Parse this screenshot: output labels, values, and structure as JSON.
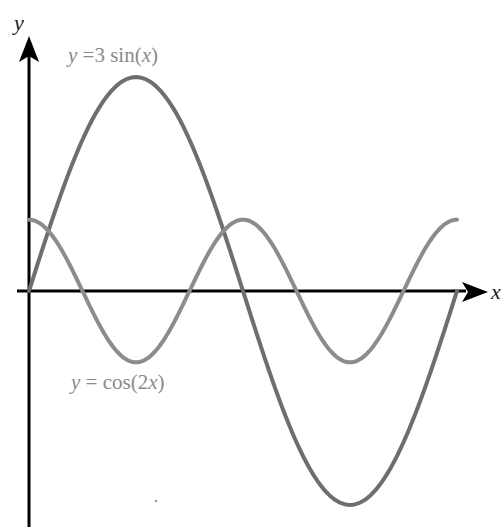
{
  "chart_data": {
    "type": "line",
    "title": "",
    "xlabel": "x",
    "ylabel": "y",
    "xlim": [
      0,
      6.2832
    ],
    "ylim": [
      -3,
      3
    ],
    "grid": false,
    "legend": "inline labels",
    "series": [
      {
        "name": "y = 3 sin(x)",
        "label": "y =3 sin(x)",
        "function": "3*sin(x)",
        "color": "#6e6e6e",
        "x": [
          0,
          0.7854,
          1.5708,
          2.3562,
          3.1416,
          3.927,
          4.7124,
          5.4978,
          6.2832
        ],
        "values": [
          0,
          2.12,
          3,
          2.12,
          0,
          -2.12,
          -3,
          -2.12,
          0
        ]
      },
      {
        "name": "y = cos(2x)",
        "label": "y = cos(2x)",
        "function": "cos(2*x)",
        "color": "#8c8c8c",
        "x": [
          0,
          0.7854,
          1.5708,
          2.3562,
          3.1416,
          3.927,
          4.7124,
          5.4978,
          6.2832
        ],
        "values": [
          1,
          0,
          -1,
          0,
          1,
          0,
          -1,
          0,
          1
        ]
      }
    ],
    "annotations": [
      {
        "text": "y =3 sin(x)",
        "near": "top, above sin peak"
      },
      {
        "text": "y = cos(2x)",
        "near": "below cos minimum at x=π/2"
      }
    ]
  },
  "axes": {
    "x_label": "x",
    "y_label": "y"
  },
  "labels": {
    "sin_prefix": "y",
    "sin_rest": " =3 sin(",
    "sin_var": "x",
    "sin_close": ")",
    "cos_prefix": "y",
    "cos_rest": " = cos(2",
    "cos_var": "x",
    "cos_close": ")"
  },
  "style": {
    "axis_color": "#000000",
    "sin_color": "#6e6e6e",
    "cos_color": "#8c8c8c",
    "label_color": "#8a8a8a"
  }
}
